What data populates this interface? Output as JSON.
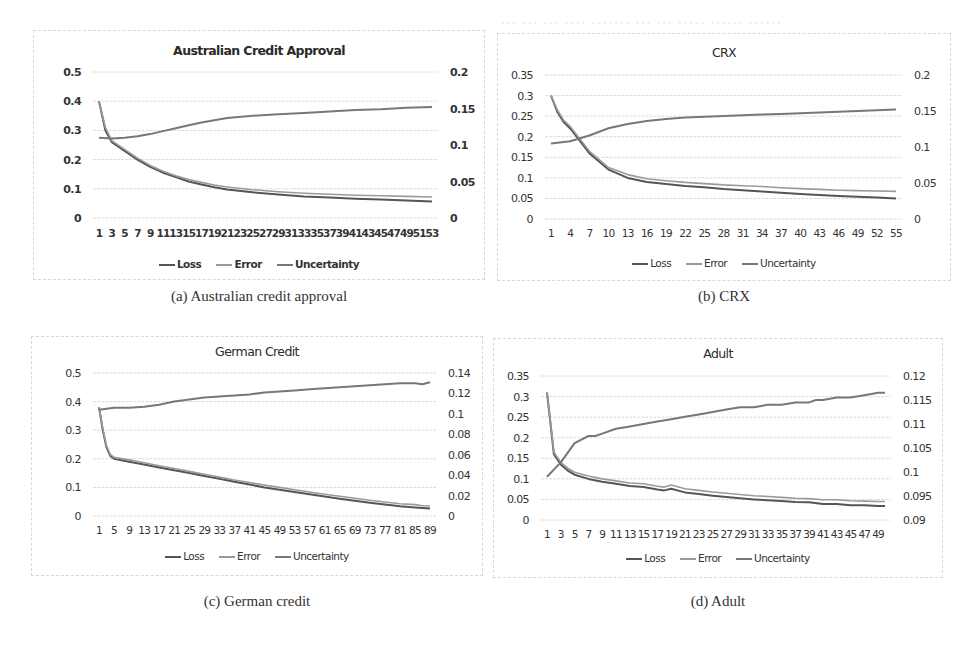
{
  "figure": {
    "panels": [
      {
        "id": "a",
        "title": "Australian Credit Approval",
        "caption": "(a) Australian credit approval",
        "legend": [
          "Loss",
          "Error",
          "Uncertainty"
        ]
      },
      {
        "id": "b",
        "title": "CRX",
        "caption": "(b) CRX",
        "legend": [
          "Loss",
          "Error",
          "Uncertainty"
        ]
      },
      {
        "id": "c",
        "title": "German Credit",
        "caption": "(c) German credit",
        "legend": [
          "Loss",
          "Error",
          "Uncertainty"
        ]
      },
      {
        "id": "d",
        "title": "Adult",
        "caption": "(d) Adult",
        "legend": [
          "Loss",
          "Error",
          "Uncertainty"
        ]
      }
    ],
    "colors": {
      "loss": "#555555",
      "error": "#9a9a9a",
      "uncertainty": "#777777",
      "grid": "#dcdcdc",
      "frame": "#d8d8d8"
    }
  },
  "chart_data": [
    {
      "type": "line",
      "title": "Australian Credit Approval",
      "xlabel": "",
      "ylabel": "",
      "x_range": [
        1,
        53
      ],
      "x_tick_labels": [
        "1",
        "3",
        "5",
        "7",
        "9",
        "11",
        "13",
        "15",
        "17",
        "19",
        "21",
        "23",
        "25",
        "27",
        "29",
        "31",
        "33",
        "35",
        "37",
        "39",
        "41",
        "43",
        "45",
        "47",
        "49",
        "51",
        "53"
      ],
      "y_left": {
        "range": [
          0,
          0.5
        ],
        "ticks": [
          "0",
          "0.1",
          "0.2",
          "0.3",
          "0.4",
          "0.5"
        ]
      },
      "y_right": {
        "range": [
          0,
          0.2
        ],
        "ticks": [
          "0",
          "0.05",
          "0.1",
          "0.15",
          "0.2"
        ]
      },
      "grid": true,
      "legend_position": "bottom",
      "series": [
        {
          "name": "Loss",
          "axis": "left",
          "x": [
            1,
            2,
            3,
            5,
            7,
            9,
            11,
            13,
            15,
            17,
            19,
            21,
            25,
            29,
            33,
            37,
            41,
            45,
            49,
            53
          ],
          "values": [
            0.4,
            0.3,
            0.26,
            0.23,
            0.2,
            0.175,
            0.155,
            0.14,
            0.125,
            0.115,
            0.105,
            0.098,
            0.088,
            0.08,
            0.074,
            0.07,
            0.066,
            0.063,
            0.06,
            0.057
          ]
        },
        {
          "name": "Error",
          "axis": "left",
          "x": [
            1,
            2,
            3,
            5,
            7,
            9,
            11,
            13,
            15,
            17,
            19,
            21,
            25,
            29,
            33,
            37,
            41,
            45,
            49,
            53
          ],
          "values": [
            0.4,
            0.31,
            0.265,
            0.235,
            0.205,
            0.18,
            0.16,
            0.145,
            0.132,
            0.122,
            0.113,
            0.106,
            0.097,
            0.09,
            0.085,
            0.081,
            0.078,
            0.076,
            0.074,
            0.072
          ]
        },
        {
          "name": "Uncertainty",
          "axis": "right",
          "x": [
            1,
            3,
            5,
            7,
            9,
            11,
            13,
            15,
            17,
            19,
            21,
            25,
            29,
            33,
            37,
            41,
            45,
            49,
            53
          ],
          "values": [
            0.11,
            0.109,
            0.11,
            0.112,
            0.115,
            0.119,
            0.123,
            0.127,
            0.131,
            0.134,
            0.137,
            0.14,
            0.142,
            0.144,
            0.146,
            0.148,
            0.149,
            0.151,
            0.152
          ]
        }
      ]
    },
    {
      "type": "line",
      "title": "CRX",
      "xlabel": "",
      "ylabel": "",
      "x_range": [
        1,
        55
      ],
      "x_tick_labels": [
        "1",
        "4",
        "7",
        "10",
        "13",
        "16",
        "19",
        "22",
        "25",
        "28",
        "31",
        "34",
        "37",
        "40",
        "43",
        "46",
        "49",
        "52",
        "55"
      ],
      "y_left": {
        "range": [
          0,
          0.35
        ],
        "ticks": [
          "0",
          "0.05",
          "0.1",
          "0.15",
          "0.2",
          "0.25",
          "0.3",
          "0.35"
        ]
      },
      "y_right": {
        "range": [
          0,
          0.2
        ],
        "ticks": [
          "0",
          "0.05",
          "0.1",
          "0.15",
          "0.2"
        ]
      },
      "grid": true,
      "legend_position": "bottom",
      "series": [
        {
          "name": "Loss",
          "axis": "left",
          "x": [
            1,
            2,
            3,
            4,
            5,
            7,
            10,
            13,
            16,
            19,
            22,
            25,
            28,
            31,
            34,
            37,
            40,
            43,
            46,
            49,
            52,
            55
          ],
          "values": [
            0.3,
            0.26,
            0.235,
            0.22,
            0.2,
            0.16,
            0.12,
            0.1,
            0.09,
            0.085,
            0.08,
            0.077,
            0.073,
            0.07,
            0.067,
            0.064,
            0.061,
            0.058,
            0.056,
            0.054,
            0.052,
            0.05
          ]
        },
        {
          "name": "Error",
          "axis": "left",
          "x": [
            1,
            2,
            3,
            4,
            5,
            7,
            10,
            13,
            16,
            19,
            22,
            25,
            28,
            31,
            34,
            37,
            40,
            43,
            46,
            49,
            52,
            55
          ],
          "values": [
            0.3,
            0.265,
            0.24,
            0.225,
            0.205,
            0.165,
            0.125,
            0.108,
            0.098,
            0.093,
            0.089,
            0.086,
            0.083,
            0.081,
            0.079,
            0.076,
            0.074,
            0.072,
            0.07,
            0.069,
            0.068,
            0.067
          ]
        },
        {
          "name": "Uncertainty",
          "axis": "right",
          "x": [
            1,
            4,
            7,
            10,
            13,
            16,
            19,
            22,
            25,
            28,
            31,
            34,
            37,
            40,
            43,
            46,
            49,
            52,
            55
          ],
          "values": [
            0.105,
            0.108,
            0.116,
            0.126,
            0.132,
            0.136,
            0.139,
            0.141,
            0.142,
            0.143,
            0.144,
            0.145,
            0.146,
            0.147,
            0.148,
            0.149,
            0.15,
            0.151,
            0.152
          ]
        }
      ]
    },
    {
      "type": "line",
      "title": "German Credit",
      "xlabel": "",
      "ylabel": "",
      "x_range": [
        1,
        89
      ],
      "x_tick_labels": [
        "1",
        "5",
        "9",
        "13",
        "17",
        "21",
        "25",
        "29",
        "33",
        "37",
        "41",
        "45",
        "49",
        "53",
        "57",
        "61",
        "65",
        "69",
        "73",
        "77",
        "81",
        "85",
        "89"
      ],
      "y_left": {
        "range": [
          0,
          0.5
        ],
        "ticks": [
          "0",
          "0.1",
          "0.2",
          "0.3",
          "0.4",
          "0.5"
        ]
      },
      "y_right": {
        "range": [
          0,
          0.14
        ],
        "ticks": [
          "0",
          "0.02",
          "0.04",
          "0.06",
          "0.08",
          "0.1",
          "0.12",
          "0.14"
        ]
      },
      "grid": true,
      "legend_position": "bottom",
      "series": [
        {
          "name": "Loss",
          "axis": "left",
          "x": [
            1,
            2,
            3,
            4,
            5,
            9,
            13,
            17,
            21,
            25,
            29,
            33,
            37,
            41,
            45,
            49,
            53,
            57,
            61,
            65,
            69,
            73,
            77,
            81,
            85,
            87,
            89
          ],
          "values": [
            0.38,
            0.3,
            0.24,
            0.21,
            0.2,
            0.19,
            0.18,
            0.17,
            0.16,
            0.15,
            0.14,
            0.13,
            0.12,
            0.11,
            0.1,
            0.092,
            0.084,
            0.076,
            0.068,
            0.06,
            0.053,
            0.046,
            0.04,
            0.034,
            0.03,
            0.028,
            0.026
          ]
        },
        {
          "name": "Error",
          "axis": "left",
          "x": [
            1,
            2,
            3,
            4,
            5,
            9,
            13,
            17,
            21,
            25,
            29,
            33,
            37,
            41,
            45,
            49,
            53,
            57,
            61,
            65,
            69,
            73,
            77,
            81,
            85,
            87,
            89
          ],
          "values": [
            0.38,
            0.305,
            0.245,
            0.215,
            0.205,
            0.196,
            0.186,
            0.176,
            0.166,
            0.156,
            0.146,
            0.136,
            0.126,
            0.117,
            0.108,
            0.1,
            0.092,
            0.084,
            0.076,
            0.069,
            0.062,
            0.055,
            0.049,
            0.043,
            0.04,
            0.036,
            0.035
          ]
        },
        {
          "name": "Uncertainty",
          "axis": "right",
          "x": [
            1,
            5,
            9,
            13,
            17,
            21,
            25,
            29,
            33,
            37,
            41,
            45,
            49,
            53,
            57,
            61,
            65,
            69,
            73,
            77,
            81,
            85,
            87,
            89
          ],
          "values": [
            0.104,
            0.106,
            0.106,
            0.107,
            0.109,
            0.112,
            0.114,
            0.116,
            0.117,
            0.118,
            0.119,
            0.121,
            0.122,
            0.123,
            0.124,
            0.125,
            0.126,
            0.127,
            0.128,
            0.129,
            0.13,
            0.13,
            0.129,
            0.131
          ]
        }
      ]
    },
    {
      "type": "line",
      "title": "Adult",
      "xlabel": "",
      "ylabel": "",
      "x_range": [
        1,
        50
      ],
      "x_tick_labels": [
        "1",
        "3",
        "5",
        "7",
        "9",
        "11",
        "13",
        "15",
        "17",
        "19",
        "21",
        "23",
        "25",
        "27",
        "29",
        "31",
        "33",
        "35",
        "37",
        "39",
        "41",
        "43",
        "45",
        "47",
        "49"
      ],
      "y_left": {
        "range": [
          0,
          0.35
        ],
        "ticks": [
          "0",
          "0.05",
          "0.1",
          "0.15",
          "0.2",
          "0.25",
          "0.3",
          "0.35"
        ]
      },
      "y_right": {
        "range": [
          0.09,
          0.12
        ],
        "ticks": [
          "0.09",
          "0.095",
          "0.1",
          "0.105",
          "0.11",
          "0.115",
          "0.12"
        ]
      },
      "grid": true,
      "legend_position": "bottom",
      "series": [
        {
          "name": "Loss",
          "axis": "left",
          "x": [
            1,
            2,
            3,
            4,
            5,
            7,
            9,
            11,
            13,
            15,
            17,
            18,
            19,
            21,
            23,
            25,
            27,
            29,
            31,
            33,
            35,
            37,
            39,
            41,
            43,
            45,
            47,
            49,
            50
          ],
          "values": [
            0.31,
            0.16,
            0.135,
            0.12,
            0.11,
            0.1,
            0.093,
            0.088,
            0.083,
            0.08,
            0.074,
            0.072,
            0.076,
            0.067,
            0.063,
            0.059,
            0.056,
            0.053,
            0.05,
            0.048,
            0.046,
            0.044,
            0.043,
            0.039,
            0.039,
            0.036,
            0.036,
            0.034,
            0.034
          ]
        },
        {
          "name": "Error",
          "axis": "left",
          "x": [
            1,
            2,
            3,
            4,
            5,
            7,
            9,
            11,
            13,
            15,
            17,
            18,
            19,
            21,
            23,
            25,
            27,
            29,
            31,
            33,
            35,
            37,
            39,
            41,
            43,
            45,
            47,
            49,
            50
          ],
          "values": [
            0.31,
            0.165,
            0.14,
            0.126,
            0.116,
            0.107,
            0.1,
            0.095,
            0.09,
            0.088,
            0.082,
            0.08,
            0.085,
            0.076,
            0.072,
            0.068,
            0.065,
            0.062,
            0.059,
            0.057,
            0.055,
            0.053,
            0.052,
            0.049,
            0.049,
            0.047,
            0.046,
            0.045,
            0.045
          ]
        },
        {
          "name": "Uncertainty",
          "axis": "right",
          "x": [
            1,
            3,
            5,
            7,
            8,
            9,
            11,
            13,
            15,
            17,
            19,
            21,
            23,
            25,
            27,
            29,
            31,
            33,
            35,
            37,
            38,
            39,
            40,
            41,
            43,
            45,
            47,
            49,
            50
          ],
          "values": [
            0.099,
            0.102,
            0.106,
            0.1075,
            0.1075,
            0.108,
            0.109,
            0.1095,
            0.11,
            0.1105,
            0.111,
            0.1115,
            0.112,
            0.1125,
            0.113,
            0.1135,
            0.1135,
            0.114,
            0.114,
            0.1145,
            0.1145,
            0.1145,
            0.115,
            0.115,
            0.1155,
            0.1155,
            0.116,
            0.1165,
            0.1165
          ]
        }
      ]
    }
  ]
}
